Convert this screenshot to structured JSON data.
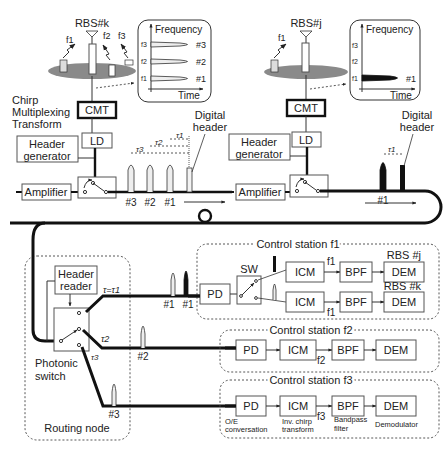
{
  "rbs_k": {
    "label": "RBS#k",
    "freqs": [
      "f1",
      "f2",
      "f3"
    ],
    "plot": {
      "title": "Frequency",
      "xlabel": "Time",
      "ylabels": [
        "f3",
        "f2",
        "f1"
      ],
      "series": [
        "#3",
        "#2",
        "#1"
      ]
    }
  },
  "rbs_j": {
    "label": "RBS#j",
    "freq": "f1",
    "plot": {
      "title": "Frequency",
      "xlabel": "Time",
      "ylabels": [
        "f3",
        "f2",
        "f1"
      ],
      "series": [
        "#1"
      ]
    }
  },
  "left_chain": {
    "cmt_caption": [
      "Chirp",
      "Multiplexing",
      "Transform"
    ],
    "cmt": "CMT",
    "ld": "LD",
    "header_generator": [
      "Header",
      "generator"
    ],
    "amplifier": "Amplifier",
    "digital_header": [
      "Digital",
      "header"
    ],
    "taus": [
      "τ3",
      "τ2",
      "τ1"
    ],
    "pulses": [
      "#3",
      "#2",
      "#1"
    ]
  },
  "right_chain": {
    "cmt": "CMT",
    "ld": "LD",
    "header_generator": [
      "Header",
      "generator"
    ],
    "amplifier": "Amplifier",
    "digital_header": [
      "Digital",
      "header"
    ],
    "tau": "τ1",
    "pulse": "#1"
  },
  "routing_node": {
    "label": "Routing node",
    "header_reader": [
      "Header",
      "reader"
    ],
    "photonic_switch": [
      "Photonic",
      "switch"
    ],
    "taus": [
      "τ=τ1",
      "τ2",
      "τ3"
    ],
    "pulses": [
      "#1",
      "#1",
      "#2",
      "#3"
    ]
  },
  "cs1": {
    "title": "Control station f1",
    "pd": "PD",
    "sw": "SW",
    "rows": [
      {
        "rbs": "RBS #j",
        "icm": "ICM",
        "freq": "f1",
        "bpf": "BPF",
        "dem": "DEM"
      },
      {
        "rbs": "RBS #k",
        "icm": "ICM",
        "freq": "f1",
        "bpf": "BPF",
        "dem": "DEM"
      }
    ]
  },
  "cs2": {
    "title": "Control station f2",
    "pd": "PD",
    "icm": "ICM",
    "freq": "f2",
    "bpf": "BPF",
    "dem": "DEM"
  },
  "cs3": {
    "title": "Control station f3",
    "pd": "PD",
    "icm": "ICM",
    "freq": "f3",
    "bpf": "BPF",
    "dem": "DEM",
    "captions": {
      "pd": [
        "O/E",
        "conversation"
      ],
      "icm": [
        "Inv. chirp",
        "transform"
      ],
      "bpf": [
        "Bandpass",
        "filter"
      ],
      "dem": "Demodulator"
    }
  }
}
